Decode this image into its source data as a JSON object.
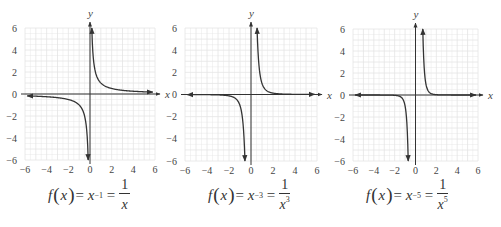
{
  "chart_data": [
    {
      "type": "line",
      "title": "f(x) = x^-1 = 1/x",
      "xlabel": "x",
      "ylabel": "y",
      "xlim": [
        -6,
        6
      ],
      "ylim": [
        -6,
        6
      ],
      "xticks": [
        -6,
        -4,
        -2,
        0,
        2,
        4,
        6
      ],
      "yticks": [
        -6,
        -4,
        -2,
        0,
        2,
        4,
        6
      ],
      "grid": true,
      "series": [
        {
          "name": "1/x",
          "exponent": -1,
          "x": [
            -6,
            -4,
            -2,
            -1,
            -0.5,
            -0.25,
            -0.17,
            0.17,
            0.25,
            0.5,
            1,
            2,
            4,
            6
          ],
          "y": [
            -0.17,
            -0.25,
            -0.5,
            -1,
            -2,
            -4,
            -6,
            6,
            4,
            2,
            1,
            0.5,
            0.25,
            0.17
          ]
        }
      ]
    },
    {
      "type": "line",
      "title": "f(x) = x^-3 = 1/x^3",
      "xlabel": "x",
      "ylabel": "y",
      "xlim": [
        -6,
        6
      ],
      "ylim": [
        -6,
        6
      ],
      "xticks": [
        -6,
        -4,
        -2,
        0,
        2,
        4,
        6
      ],
      "yticks": [
        -6,
        -4,
        -2,
        0,
        2,
        4,
        6
      ],
      "grid": true,
      "series": [
        {
          "name": "1/x^3",
          "exponent": -3,
          "x": [
            -6,
            -4,
            -2,
            -1,
            -0.75,
            -0.55,
            0.55,
            0.75,
            1,
            2,
            4,
            6
          ],
          "y": [
            -0.005,
            -0.016,
            -0.125,
            -1,
            -2.37,
            -6,
            6,
            2.37,
            1,
            0.125,
            0.016,
            0.005
          ]
        }
      ]
    },
    {
      "type": "line",
      "title": "f(x) = x^-5 = 1/x^5",
      "xlabel": "x",
      "ylabel": "y",
      "xlim": [
        -6,
        6
      ],
      "ylim": [
        -6,
        6
      ],
      "xticks": [
        -6,
        -4,
        -2,
        0,
        2,
        4,
        6
      ],
      "yticks": [
        -6,
        -4,
        -2,
        0,
        2,
        4,
        6
      ],
      "grid": true,
      "series": [
        {
          "name": "1/x^5",
          "exponent": -5,
          "x": [
            -6,
            -4,
            -2,
            -1,
            -0.8,
            -0.7,
            0.7,
            0.8,
            1,
            2,
            4,
            6
          ],
          "y": [
            -0.0001,
            -0.001,
            -0.031,
            -1,
            -3.05,
            -6,
            6,
            3.05,
            1,
            0.031,
            0.001,
            0.0001
          ]
        }
      ]
    }
  ],
  "panels": [
    {
      "formula": {
        "f": "f",
        "x": "x",
        "eq1": "=",
        "base": "x",
        "exp": "−1",
        "eq2": "=",
        "num": "1",
        "den": "x",
        "den_exp": ""
      }
    },
    {
      "formula": {
        "f": "f",
        "x": "x",
        "eq1": "=",
        "base": "x",
        "exp": "−3",
        "eq2": "=",
        "num": "1",
        "den": "x",
        "den_exp": "3"
      }
    },
    {
      "formula": {
        "f": "f",
        "x": "x",
        "eq1": "=",
        "base": "x",
        "exp": "−5",
        "eq2": "=",
        "num": "1",
        "den": "x",
        "den_exp": "5"
      }
    }
  ],
  "axis_labels": {
    "x": "x",
    "y": "y"
  },
  "ticks": [
    "−6",
    "−4",
    "−2",
    "0",
    "2",
    "4",
    "6"
  ],
  "colors": {
    "curve": "#333333",
    "axis": "#333333",
    "grid": "#e4e4e4"
  }
}
